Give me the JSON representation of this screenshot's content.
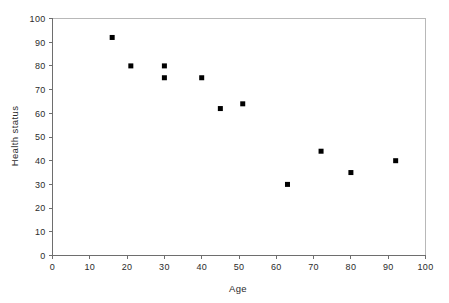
{
  "chart_data": {
    "type": "scatter",
    "title": "",
    "xlabel": "Age",
    "ylabel": "Health status",
    "xlim": [
      0,
      100
    ],
    "ylim": [
      0,
      100
    ],
    "xticks": [
      0,
      10,
      20,
      30,
      40,
      50,
      60,
      70,
      80,
      90,
      100
    ],
    "yticks": [
      0,
      10,
      20,
      30,
      40,
      50,
      60,
      70,
      80,
      90,
      100
    ],
    "xtick_labels": [
      "0",
      "10",
      "20",
      "30",
      "40",
      "50",
      "60",
      "70",
      "80",
      "90",
      "100"
    ],
    "ytick_labels": [
      "0",
      "10",
      "20",
      "30",
      "40",
      "50",
      "60",
      "70",
      "80",
      "90",
      "100"
    ],
    "grid": false,
    "legend": false,
    "legend_position": "none",
    "marker": "square",
    "marker_color": "#000000",
    "marker_size": 5,
    "series": [
      {
        "name": "Health status by age",
        "points": [
          {
            "x": 16,
            "y": 92
          },
          {
            "x": 21,
            "y": 80
          },
          {
            "x": 30,
            "y": 80
          },
          {
            "x": 30,
            "y": 75
          },
          {
            "x": 40,
            "y": 75
          },
          {
            "x": 45,
            "y": 62
          },
          {
            "x": 51,
            "y": 64
          },
          {
            "x": 63,
            "y": 30
          },
          {
            "x": 72,
            "y": 44
          },
          {
            "x": 80,
            "y": 35
          },
          {
            "x": 92,
            "y": 40
          }
        ]
      }
    ],
    "x": [
      16,
      21,
      30,
      30,
      40,
      45,
      51,
      63,
      72,
      80,
      92
    ],
    "y": [
      92,
      80,
      80,
      75,
      75,
      62,
      64,
      30,
      44,
      35,
      40
    ]
  },
  "axes": {
    "x_title": "Age",
    "y_title": "Health status"
  }
}
